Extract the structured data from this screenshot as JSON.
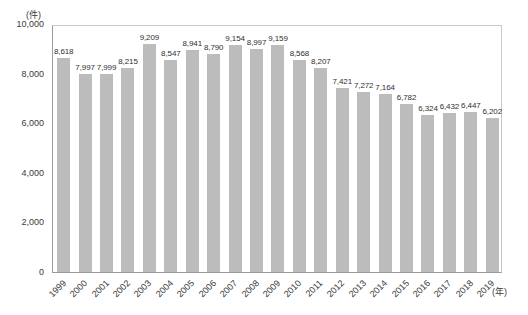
{
  "chart_data": {
    "type": "bar",
    "title": "",
    "subtitle": "",
    "xlabel": "(年)",
    "ylabel": "(件)",
    "ylim": [
      0,
      10000
    ],
    "ytick_values": [
      10000,
      8000,
      6000,
      4000,
      2000,
      0
    ],
    "ytick_labels": [
      "10,000",
      "8,000",
      "6,000",
      "4,000",
      "2,000",
      "0"
    ],
    "grid": false,
    "legend": null,
    "bar_color": "#bcbcbc",
    "categories": [
      "1999",
      "2000",
      "2001",
      "2002",
      "2003",
      "2004",
      "2005",
      "2006",
      "2007",
      "2008",
      "2009",
      "2010",
      "2011",
      "2012",
      "2013",
      "2014",
      "2015",
      "2016",
      "2017",
      "2018",
      "2019"
    ],
    "values": [
      8618,
      7997,
      7999,
      8215,
      9209,
      8547,
      8941,
      8790,
      9154,
      8997,
      9159,
      8568,
      8207,
      7421,
      7272,
      7164,
      6782,
      6324,
      6432,
      6447,
      6202
    ],
    "value_labels": [
      "8,618",
      "7,997",
      "7,999",
      "8,215",
      "9,209",
      "8,547",
      "8,941",
      "8,790",
      "9,154",
      "8,997",
      "9,159",
      "8,568",
      "8,207",
      "7,421",
      "7,272",
      "7,164",
      "6,782",
      "6,324",
      "6,432",
      "6,447",
      "6,202"
    ]
  }
}
